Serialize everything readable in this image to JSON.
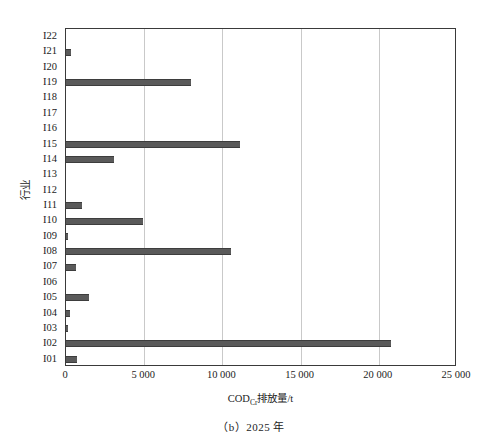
{
  "figure": {
    "caption": "（b）2025 年",
    "y_axis_title": "行业",
    "x_axis_title_pre": "COD",
    "x_axis_title_sub": "Cr",
    "x_axis_title_post": "排放量/t"
  },
  "chart_data": {
    "type": "bar",
    "orientation": "horizontal",
    "title": "（b）2025 年",
    "xlabel": "CODCr排放量/t",
    "ylabel": "行业",
    "xlim": [
      0,
      25000
    ],
    "ylim_categories": 22,
    "grid": "vertical-only",
    "legend": "none",
    "bar_color": "#5a5a5a",
    "xticks": [
      0,
      5000,
      10000,
      15000,
      20000,
      25000
    ],
    "xticklabels": [
      "0",
      "5 000",
      "10 000",
      "15 000",
      "20 000",
      "25 000"
    ],
    "categories": [
      "I01",
      "I02",
      "I03",
      "I04",
      "I05",
      "I06",
      "I07",
      "I08",
      "I09",
      "I10",
      "I11",
      "I12",
      "I13",
      "I14",
      "I15",
      "I16",
      "I17",
      "I18",
      "I19",
      "I20",
      "I21",
      "I22"
    ],
    "values": [
      700,
      20800,
      60,
      250,
      1450,
      0,
      620,
      10550,
      70,
      4950,
      1000,
      0,
      0,
      3100,
      11100,
      0,
      0,
      0,
      8000,
      0,
      300,
      0
    ]
  }
}
